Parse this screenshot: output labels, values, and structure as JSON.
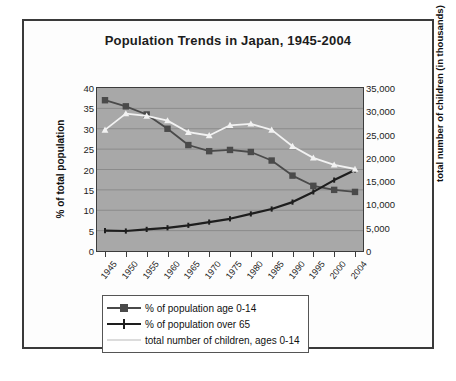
{
  "chart_data": {
    "type": "line",
    "title": "Population Trends in Japan, 1945-2004",
    "xlabel": "",
    "ylabel": "% of total population",
    "y2label": "total number of children (in thousands)",
    "categories": [
      "1945",
      "1950",
      "1955",
      "1960",
      "1965",
      "1970",
      "1975",
      "1980",
      "1985",
      "1990",
      "1995",
      "2000",
      "2004"
    ],
    "ylim": [
      0,
      40
    ],
    "yticks": [
      "0",
      "5",
      "10",
      "15",
      "20",
      "25",
      "30",
      "35",
      "40"
    ],
    "y2lim": [
      0,
      35000
    ],
    "y2ticks": [
      "0",
      "5,000",
      "10,000",
      "15,000",
      "20,000",
      "25,000",
      "30,000",
      "35,000"
    ],
    "grid": true,
    "legend_position": "bottom",
    "plot_background": "#a8a8a8",
    "series": [
      {
        "name": "% of population age 0-14",
        "axis": "left",
        "color": "#4a4a4a",
        "marker": "square",
        "values": [
          37.0,
          35.5,
          33.5,
          30.0,
          26.0,
          24.5,
          24.8,
          24.3,
          22.2,
          18.5,
          16.0,
          15.0,
          14.5
        ]
      },
      {
        "name": "% of population over 65",
        "axis": "left",
        "color": "#1e1e1e",
        "marker": "tick",
        "values": [
          5.0,
          4.9,
          5.3,
          5.7,
          6.3,
          7.1,
          7.9,
          9.1,
          10.3,
          12.0,
          14.5,
          17.4,
          19.9
        ]
      },
      {
        "name": "total number of children, ages 0-14",
        "axis": "right",
        "color": "#f2f2f2",
        "marker": "triangle",
        "values": [
          26000,
          29500,
          29000,
          28000,
          25500,
          24800,
          27000,
          27300,
          26000,
          22500,
          20000,
          18500,
          17600
        ]
      }
    ]
  },
  "legend": {
    "items": [
      {
        "label": "% of population age 0-14"
      },
      {
        "label": "% of population over 65"
      },
      {
        "label": "total number of children, ages 0-14"
      }
    ]
  }
}
